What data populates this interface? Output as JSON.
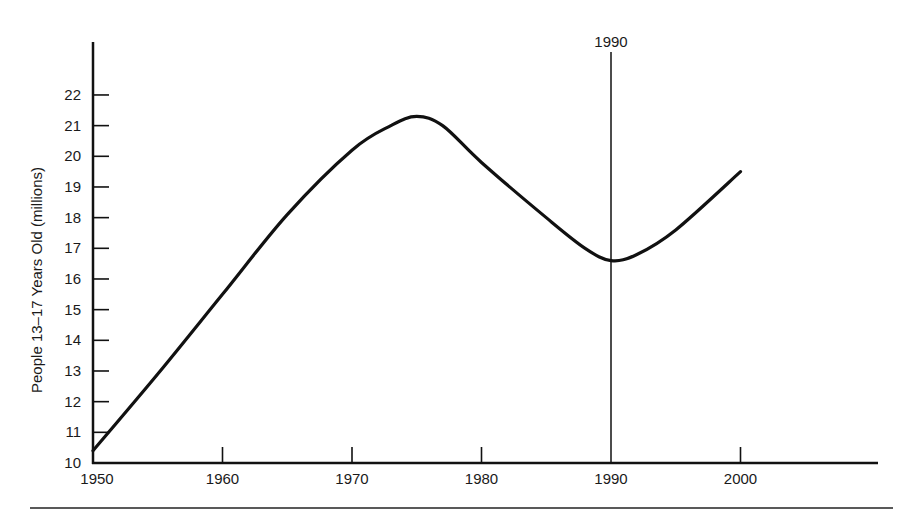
{
  "chart_data": {
    "type": "line",
    "title": "",
    "xlabel": "",
    "ylabel": "People 13–17 Years Old (millions)",
    "xlim": [
      1950,
      2010
    ],
    "ylim": [
      10,
      23
    ],
    "grid": false,
    "x_ticks": [
      1950,
      1960,
      1970,
      1980,
      1990,
      2000
    ],
    "x_tick_labels": [
      "1950",
      "1960",
      "1970",
      "1980",
      "1990",
      "2000"
    ],
    "y_ticks": [
      10,
      11,
      12,
      13,
      14,
      15,
      16,
      17,
      18,
      19,
      20,
      21,
      22
    ],
    "y_tick_labels": [
      "10",
      "11",
      "12",
      "13",
      "14",
      "15",
      "16",
      "17",
      "18",
      "19",
      "20",
      "21",
      "22"
    ],
    "series": [
      {
        "name": "People 13–17 Years Old",
        "x": [
          1950,
          1955,
          1960,
          1965,
          1970,
          1973,
          1975,
          1977,
          1980,
          1985,
          1988,
          1990,
          1992,
          1995,
          2000
        ],
        "values": [
          10.4,
          12.9,
          15.5,
          18.1,
          20.2,
          21.0,
          21.3,
          21.0,
          19.8,
          18.0,
          17.0,
          16.6,
          16.8,
          17.6,
          19.5
        ]
      }
    ],
    "annotations": [
      {
        "type": "vertical-line",
        "x": 1990,
        "label": "1990"
      }
    ]
  },
  "ui": {
    "y_axis_title": "People 13–17 Years Old (millions)",
    "annotation_label": "1990"
  }
}
